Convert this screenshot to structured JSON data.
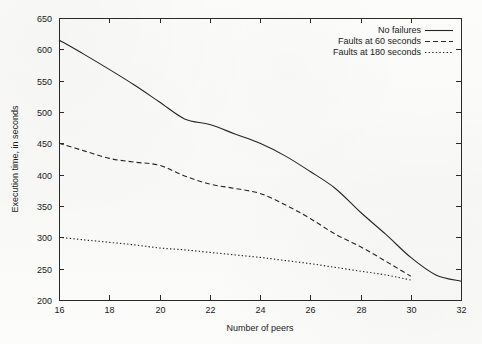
{
  "chart_data": {
    "type": "line",
    "title": "",
    "xlabel": "Number of peers",
    "ylabel": "Execution time, in seconds",
    "xlim": [
      16,
      32
    ],
    "ylim": [
      200,
      650
    ],
    "xticks": [
      16,
      18,
      20,
      22,
      24,
      26,
      28,
      30,
      32
    ],
    "yticks": [
      200,
      250,
      300,
      350,
      400,
      450,
      500,
      550,
      600,
      650
    ],
    "grid": false,
    "legend_position": "top-right",
    "line_color": "#262626",
    "series": [
      {
        "name": "No failures",
        "style": "solid",
        "x": [
          16,
          17,
          18,
          19,
          20,
          21,
          22,
          23,
          24,
          25,
          26,
          27,
          28,
          29,
          30,
          31,
          32
        ],
        "values": [
          615,
          592,
          568,
          543,
          516,
          489,
          480,
          465,
          450,
          430,
          405,
          378,
          340,
          305,
          268,
          240,
          230
        ]
      },
      {
        "name": "Faults at 60 seconds",
        "style": "dashed",
        "x": [
          16,
          17,
          18,
          19,
          20,
          21,
          22,
          23,
          24,
          25,
          26,
          27,
          28,
          29,
          30
        ],
        "values": [
          450,
          438,
          426,
          420,
          415,
          398,
          385,
          378,
          370,
          352,
          330,
          305,
          285,
          262,
          238
        ]
      },
      {
        "name": "Faults at 180 seconds",
        "style": "dotted",
        "x": [
          16,
          17,
          18,
          19,
          20,
          21,
          22,
          23,
          24,
          25,
          26,
          27,
          28,
          29,
          30
        ],
        "values": [
          300,
          296,
          292,
          288,
          283,
          280,
          276,
          272,
          268,
          263,
          258,
          252,
          246,
          240,
          232
        ]
      }
    ]
  },
  "axes": {
    "x_title": "Number of peers",
    "y_title": "Execution time, in seconds",
    "x_tick_labels": [
      "16",
      "18",
      "20",
      "22",
      "24",
      "26",
      "28",
      "30",
      "32"
    ],
    "y_tick_labels": [
      "200",
      "250",
      "300",
      "350",
      "400",
      "450",
      "500",
      "550",
      "600",
      "650"
    ]
  },
  "legend": {
    "entries": [
      {
        "label": "No failures",
        "style": "solid"
      },
      {
        "label": "Faults at 60 seconds",
        "style": "dashed"
      },
      {
        "label": "Faults at 180 seconds",
        "style": "dotted"
      }
    ]
  }
}
